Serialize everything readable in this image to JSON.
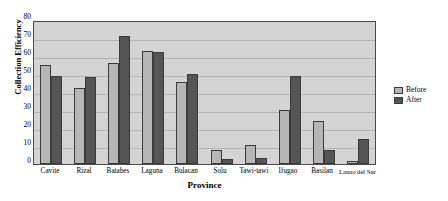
{
  "chart_data": {
    "type": "bar",
    "title": "",
    "xlabel": "Province",
    "ylabel": "Collection Efficiency",
    "ylim": [
      0,
      80
    ],
    "ytick_step": 10,
    "yticks": [
      "0",
      "10",
      "20",
      "30",
      "40",
      "50",
      "60",
      "70",
      "80"
    ],
    "grid": true,
    "legend_position": "right",
    "categories": [
      "Cavite",
      "Rizal",
      "Batabes",
      "Laguna",
      "Bulacan",
      "Solu",
      "Tawi-tawi",
      "Ifugao",
      "Basilan",
      "Lanao del Sur"
    ],
    "series": [
      {
        "name": "Before",
        "color": "#b6b6b6",
        "values": [
          55,
          42.5,
          56,
          63,
          45.5,
          8,
          10.5,
          30,
          24,
          1.5
        ]
      },
      {
        "name": "After",
        "color": "#555555",
        "values": [
          49,
          48.5,
          71,
          62,
          50,
          3,
          3.5,
          49,
          8,
          14
        ]
      }
    ]
  },
  "legend": {
    "items": [
      {
        "label": "Before"
      },
      {
        "label": "After"
      }
    ]
  },
  "colors": {
    "plot_background": "#d4d4d4",
    "gridline": "#b3b3b3",
    "axis": "#4a4a4a",
    "before": "#b6b6b6",
    "after": "#555555"
  }
}
